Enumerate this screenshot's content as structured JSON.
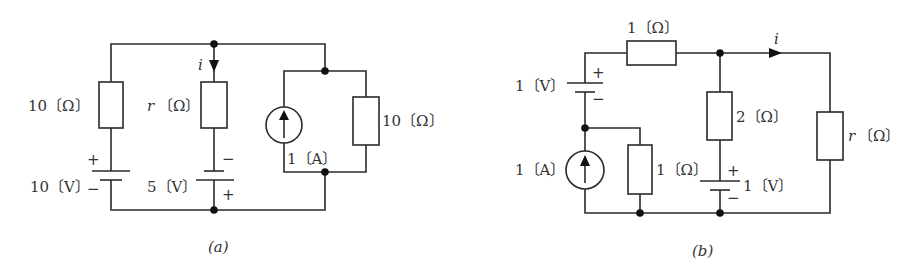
{
  "diagrams": {
    "a": {
      "caption": "(a)",
      "resistor_left": "10〔Ω〕",
      "resistor_mid": "(Ω〕",
      "resistor_mid_var": "r",
      "resistor_right": "10〔Ω〕",
      "current_label": "i",
      "battery_left": "10〔V〕",
      "battery_mid": "5〔V〕",
      "current_source": "1〔A〕",
      "plus": "+",
      "minus": "−"
    },
    "b": {
      "caption": "(b)",
      "resistor_top": "1〔Ω〕",
      "resistor_mid": "2〔Ω〕",
      "resistor_left": "1〔Ω〕",
      "resistor_right": "〔Ω〕",
      "resistor_right_var": "r",
      "current_label": "i",
      "battery_left": "1〔V〕",
      "battery_mid": "1〔V〕",
      "current_source": "1〔A〕",
      "plus": "+",
      "minus": "−"
    }
  }
}
